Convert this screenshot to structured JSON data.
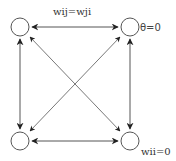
{
  "diagram": {
    "labels": {
      "symmetric_weights": "wij=wji",
      "threshold": "θ=0",
      "self_weight": "wii=0"
    },
    "nodes": [
      {
        "id": "top-left",
        "x": 20,
        "y": 27
      },
      {
        "id": "top-right",
        "x": 130,
        "y": 27
      },
      {
        "id": "bottom-left",
        "x": 20,
        "y": 141
      },
      {
        "id": "bottom-right",
        "x": 130,
        "y": 141
      }
    ],
    "edges": [
      {
        "from": "top-left",
        "to": "top-right",
        "bidirectional": true
      },
      {
        "from": "top-left",
        "to": "bottom-left",
        "bidirectional": true
      },
      {
        "from": "top-right",
        "to": "bottom-right",
        "bidirectional": true
      },
      {
        "from": "bottom-left",
        "to": "bottom-right",
        "bidirectional": true
      },
      {
        "from": "top-left",
        "to": "bottom-right",
        "bidirectional": true
      },
      {
        "from": "top-right",
        "to": "bottom-left",
        "bidirectional": true
      }
    ],
    "colors": {
      "stroke": "#555555",
      "arrow": "#222222",
      "node_fill": "#ffffff"
    }
  }
}
